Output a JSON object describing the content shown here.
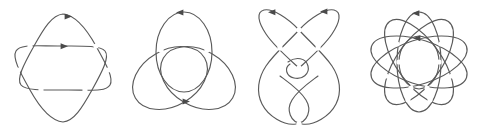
{
  "figure": {
    "background_color": "#ffffff",
    "stroke_color": "#5a5a5a",
    "arrow_color": "#4a4a4a",
    "stroke_width": 1.15,
    "panel_count": 4
  },
  "panels": [
    {
      "id": "panel-1",
      "name": "six-pointed-star-link",
      "label": "",
      "crossings": 6,
      "components": 2,
      "arrow_count": 2,
      "arrow_directions": [
        "right",
        "right"
      ],
      "description": "Six-pointed star (Star of David) link formed from two interlocked triangular components with rounded petals"
    },
    {
      "id": "panel-2",
      "name": "three-petal-trefoil-knot",
      "label": "",
      "crossings": 6,
      "components": 2,
      "arrow_count": 2,
      "arrow_directions": [
        "left",
        "right"
      ],
      "description": "Three-petal rose arrangement of interlocking loops, trefoil-like presentation"
    },
    {
      "id": "panel-3",
      "name": "vertical-twisted-link",
      "label": "",
      "crossings": 8,
      "components": 2,
      "arrow_count": 2,
      "arrow_directions": [
        "left",
        "left"
      ],
      "description": "Vertically elongated two-component link with a central clasp and upper and lower lobes"
    },
    {
      "id": "panel-4",
      "name": "five-petal-star-knot",
      "label": "",
      "crossings": 10,
      "components": 2,
      "arrow_count": 2,
      "arrow_directions": [
        "left",
        "left"
      ],
      "description": "Five-petal rose / pentagram-style knot with a nested inner loop"
    }
  ]
}
